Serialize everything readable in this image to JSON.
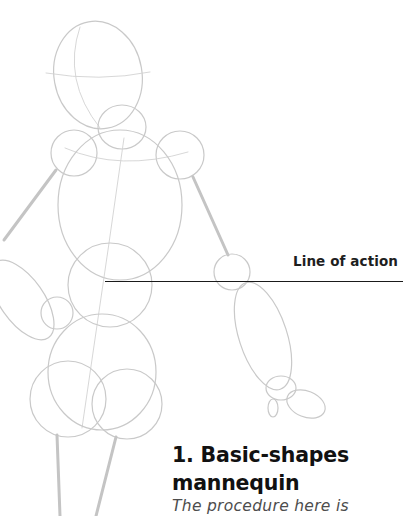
{
  "figure": {
    "annotation": {
      "label": "Line of action"
    }
  },
  "section": {
    "number": "1.",
    "title_line1": "1. Basic-shapes",
    "title_line2": "mannequin",
    "body_text": "The procedure here is"
  },
  "colors": {
    "sketch_stroke": "#c9c9c9",
    "heading": "#111111",
    "body": "#4d4d4d",
    "action_line": "#1a1a1a"
  }
}
